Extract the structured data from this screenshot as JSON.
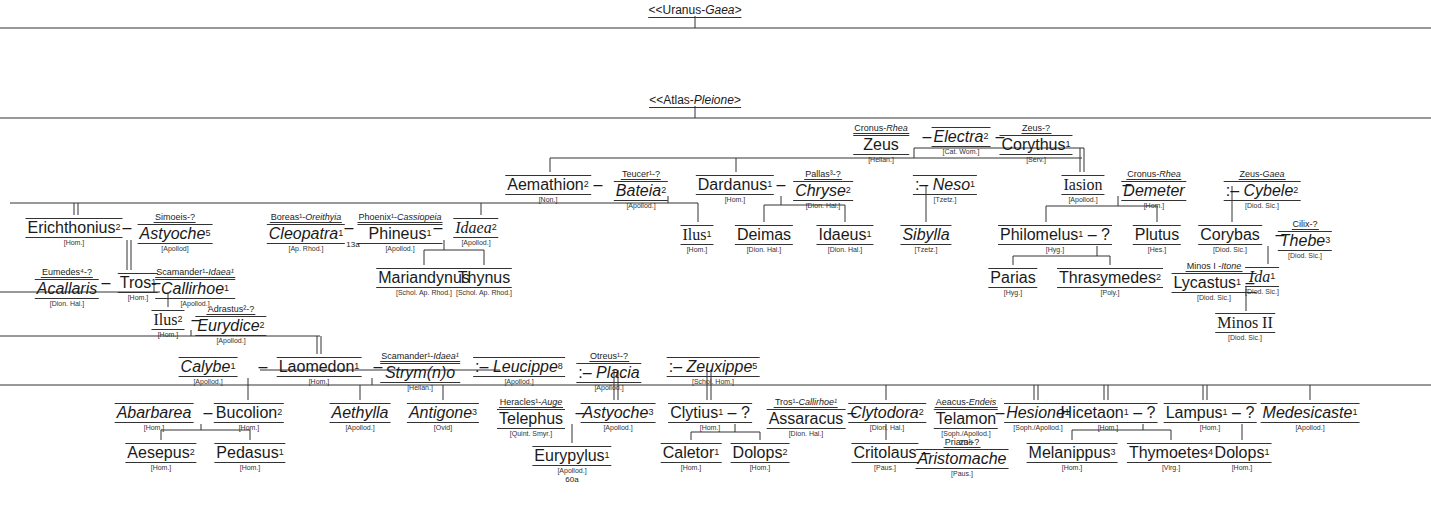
{
  "roots": [
    {
      "id": "uranus",
      "text": "<<Uranus-",
      "fem": "Gaea>",
      "x": 695,
      "y": 4
    },
    {
      "id": "atlas",
      "text": "<<Atlas-",
      "fem": "Pleione>",
      "x": 695,
      "y": 94
    }
  ],
  "nodes": [
    {
      "id": "zeus",
      "name": "Zeus",
      "sup": "",
      "fem": false,
      "src": "[Hellan.]",
      "parents_m": "Cronus-",
      "parents_f": "Rhea",
      "x": 881,
      "y": 117
    },
    {
      "id": "electra",
      "name": "Electra",
      "sup": "2",
      "fem": true,
      "src": "[Cat. Wom.]",
      "parents_m": "",
      "parents_f": "",
      "x": 961,
      "y": 127
    },
    {
      "id": "corythus",
      "name": "Corythus",
      "sup": "1",
      "fem": false,
      "src": "[Serv.]",
      "parents_m": "Zeus-?",
      "parents_f": "",
      "x": 1036,
      "y": 117
    },
    {
      "id": "aemathion",
      "name": "Aemathion",
      "sup": "2",
      "fem": false,
      "src": "[Non.]",
      "parents_m": "",
      "parents_f": "",
      "x": 548,
      "y": 175
    },
    {
      "id": "bateia",
      "name": "Bateia",
      "sup": "2",
      "fem": true,
      "src": "[Apollod.]",
      "parents_m": "Teucer¹-?",
      "parents_f": "",
      "x": 641,
      "y": 163
    },
    {
      "id": "dardanus",
      "name": "Dardanus",
      "sup": "1",
      "fem": false,
      "src": "[Hom.]",
      "parents_m": "",
      "parents_f": "",
      "x": 735,
      "y": 175
    },
    {
      "id": "chryse",
      "name": "Chryse",
      "sup": "2",
      "fem": true,
      "src": "[Dion. Hal.]",
      "parents_m": "Pallas³-?",
      "parents_f": "",
      "x": 823,
      "y": 163
    },
    {
      "id": "neso",
      "name": "Neso",
      "sup": "1",
      "fem": true,
      "prefix": ":–",
      "src": "[Tzetz.]",
      "parents_m": "",
      "parents_f": "",
      "x": 945,
      "y": 175
    },
    {
      "id": "iasion",
      "name": "Iasion",
      "sup": "",
      "fem": false,
      "serif": true,
      "src": "[Apollod.]",
      "parents_m": "",
      "parents_f": "",
      "x": 1083,
      "y": 175
    },
    {
      "id": "demeter",
      "name": "Demeter",
      "sup": "",
      "fem": true,
      "src": "[Hom.]",
      "parents_m": "Cronus-",
      "parents_f": "Rhea",
      "x": 1154,
      "y": 163
    },
    {
      "id": "cybele",
      "name": "Cybele",
      "sup": "2",
      "fem": true,
      "prefix": ":–",
      "src": "[Diod. Sic.]",
      "parents_m": "Zeus-",
      "parents_f": "Gaea",
      "x": 1262,
      "y": 163
    },
    {
      "id": "erichthonius",
      "name": "Erichthonius",
      "sup": "2",
      "fem": false,
      "src": "[Hom.]",
      "parents_m": "",
      "parents_f": "",
      "x": 74,
      "y": 218
    },
    {
      "id": "astyoche5",
      "name": "Astyoche",
      "sup": "5",
      "fem": true,
      "src": "[Apollod]",
      "parents_m": "Simoeis-?",
      "parents_f": "",
      "x": 175,
      "y": 206
    },
    {
      "id": "cleopatra",
      "name": "Cleopatra",
      "sup": "1",
      "fem": true,
      "src": "[Ap. Rhod.]",
      "parents_m": "Boreas¹-",
      "parents_f": "Oreithyia",
      "x": 306,
      "y": 206
    },
    {
      "id": "phineus",
      "name": "Phineus",
      "sup": "1",
      "fem": false,
      "src": "[Apollod.]",
      "parents_m": "Phoenix¹-",
      "parents_f": "Cassiopeia",
      "x": 400,
      "y": 206
    },
    {
      "id": "idaea2",
      "name": "Idaea",
      "sup": "2",
      "fem": true,
      "serif": true,
      "src": "[Apollod.]",
      "parents_m": "",
      "parents_f": "",
      "x": 476,
      "y": 218
    },
    {
      "id": "ilus1",
      "name": "Ilus",
      "sup": "1",
      "fem": false,
      "serif": true,
      "src": "[Hom.]",
      "parents_m": "",
      "parents_f": "",
      "x": 697,
      "y": 225
    },
    {
      "id": "deimas",
      "name": "Deimas",
      "sup": "",
      "fem": false,
      "src": "[Dion. Hal.]",
      "parents_m": "",
      "parents_f": "",
      "x": 764,
      "y": 225
    },
    {
      "id": "idaeus",
      "name": "Idaeus",
      "sup": "1",
      "fem": false,
      "src": "[Dion. Hal.]",
      "parents_m": "",
      "parents_f": "",
      "x": 845,
      "y": 225
    },
    {
      "id": "sibylla",
      "name": "Sibylla",
      "sup": "",
      "fem": true,
      "src": "[Tzetz.]",
      "parents_m": "",
      "parents_f": "",
      "x": 926,
      "y": 225
    },
    {
      "id": "philomelus",
      "name": "Philomelus",
      "sup": "1",
      "fem": false,
      "suffix": "– ?",
      "src": "[Hyg.]",
      "parents_m": "",
      "parents_f": "",
      "x": 1055,
      "y": 225
    },
    {
      "id": "plutus",
      "name": "Plutus",
      "sup": "",
      "fem": false,
      "src": "[Hes.]",
      "parents_m": "",
      "parents_f": "",
      "x": 1157,
      "y": 225
    },
    {
      "id": "corybas",
      "name": "Corybas",
      "sup": "",
      "fem": false,
      "src": "[Diod. Sic.]",
      "parents_m": "",
      "parents_f": "",
      "x": 1230,
      "y": 225
    },
    {
      "id": "thebe",
      "name": "Thebe",
      "sup": "3",
      "fem": true,
      "src": "[Diod. Sic.]",
      "parents_m": "Cilix-?",
      "parents_f": "",
      "x": 1305,
      "y": 213
    },
    {
      "id": "acallaris",
      "name": "Acallaris",
      "sup": "",
      "fem": true,
      "src": "[Dion. Hal.]",
      "parents_m": "Eumedes⁴-?",
      "parents_f": "",
      "x": 67,
      "y": 261
    },
    {
      "id": "tros",
      "name": "Tros",
      "sup": "1",
      "fem": false,
      "src": "[Hom.]",
      "parents_m": "",
      "parents_f": "",
      "x": 138,
      "y": 273
    },
    {
      "id": "callirhoe",
      "name": "Callirhoe",
      "sup": "1",
      "fem": true,
      "src": "[Apollod.]",
      "parents_m": "Scamander¹-",
      "parents_f": "Idaea¹",
      "x": 195,
      "y": 261
    },
    {
      "id": "mariandynus",
      "name": "Mariandynus",
      "sup": "",
      "fem": false,
      "src": "[Schol. Ap. Rhod.]",
      "parents_m": "",
      "parents_f": "",
      "x": 424,
      "y": 268
    },
    {
      "id": "thynus",
      "name": "Thynus",
      "sup": "",
      "fem": false,
      "src": "[Schol. Ap. Rhod.]",
      "parents_m": "",
      "parents_f": "",
      "x": 484,
      "y": 268
    },
    {
      "id": "parias",
      "name": "Parias",
      "sup": "",
      "fem": false,
      "src": "[Hyg.]",
      "parents_m": "",
      "parents_f": "",
      "x": 1013,
      "y": 268
    },
    {
      "id": "thrasymedes",
      "name": "Thrasymedes",
      "sup": "2",
      "fem": false,
      "src": "[Poly.]",
      "parents_m": "",
      "parents_f": "",
      "x": 1110,
      "y": 268
    },
    {
      "id": "lycastus",
      "name": "Lycastus",
      "sup": "1",
      "fem": false,
      "suffix": "–",
      "src": "[Diod. Sic.]",
      "parents_m": "Minos I -",
      "parents_f": "Itone",
      "x": 1214,
      "y": 255
    },
    {
      "id": "ida",
      "name": "Ida",
      "sup": "1",
      "fem": true,
      "serif": true,
      "src": "[Diod. Sic.]",
      "parents_m": "",
      "parents_f": "",
      "x": 1262,
      "y": 267
    },
    {
      "id": "minos2",
      "name": "Minos II",
      "sup": "",
      "fem": false,
      "serif": true,
      "src": "[Diod. Sic.]",
      "parents_m": "",
      "parents_f": "",
      "x": 1245,
      "y": 313
    },
    {
      "id": "ilus2",
      "name": "Ilus",
      "sup": "2",
      "fem": false,
      "serif": true,
      "src": "[Hom.]",
      "parents_m": "",
      "parents_f": "",
      "x": 168,
      "y": 310
    },
    {
      "id": "eurydice",
      "name": "Eurydice",
      "sup": "2",
      "fem": true,
      "src": "[Apollod.]",
      "parents_m": "Adrastus²-?",
      "parents_f": "",
      "x": 231,
      "y": 298
    },
    {
      "id": "calybe",
      "name": "Calybe",
      "sup": "1",
      "fem": true,
      "src": "[Apollod.]",
      "parents_m": "",
      "parents_f": "",
      "x": 208,
      "y": 357
    },
    {
      "id": "laomedon",
      "name": "Laomedon",
      "sup": "1",
      "fem": false,
      "src": "[Hom.]",
      "parents_m": "",
      "parents_f": "",
      "x": 319,
      "y": 357
    },
    {
      "id": "strymo",
      "name": "Strym(n)o",
      "sup": "",
      "fem": true,
      "src": "[Hellan.]",
      "parents_m": "Scamander¹-",
      "parents_f": "Idaea¹",
      "x": 420,
      "y": 345
    },
    {
      "id": "leucippe",
      "name": "Leucippe",
      "sup": "8",
      "fem": true,
      "prefix": ":–",
      "src": "[Apollod.]",
      "parents_m": "",
      "parents_f": "",
      "x": 519,
      "y": 357
    },
    {
      "id": "placia",
      "name": "Placia",
      "sup": "",
      "fem": true,
      "prefix": ":–",
      "src": "[Apollod.]",
      "parents_m": "Otreus¹-?",
      "parents_f": "",
      "x": 609,
      "y": 345
    },
    {
      "id": "zeuxippe",
      "name": "Zeuxippe",
      "sup": "5",
      "fem": true,
      "prefix": ":–",
      "src": "[Schol. Hom.]",
      "parents_m": "",
      "parents_f": "",
      "x": 713,
      "y": 357
    },
    {
      "id": "abarbarea",
      "name": "Abarbarea",
      "sup": "",
      "fem": true,
      "src": "[Hom.]",
      "parents_m": "",
      "parents_f": "",
      "x": 154,
      "y": 403
    },
    {
      "id": "bucolion",
      "name": "Bucolion",
      "sup": "2",
      "fem": false,
      "src": "[Hom.]",
      "parents_m": "",
      "parents_f": "",
      "x": 249,
      "y": 403
    },
    {
      "id": "aethylla",
      "name": "Aethylla",
      "sup": "",
      "fem": true,
      "src": "[Apollod.]",
      "parents_m": "",
      "parents_f": "",
      "x": 360,
      "y": 403
    },
    {
      "id": "antigone",
      "name": "Antigone",
      "sup": "3",
      "fem": true,
      "src": "[Ovid]",
      "parents_m": "",
      "parents_f": "",
      "x": 443,
      "y": 403
    },
    {
      "id": "telephus",
      "name": "Telephus",
      "sup": "",
      "fem": false,
      "src": "[Quint. Smyr.]",
      "parents_m": "Heracles¹-",
      "parents_f": "Auge",
      "x": 531,
      "y": 391
    },
    {
      "id": "astyoche3",
      "name": "Astyoche",
      "sup": "3",
      "fem": true,
      "src": "[Apollod.]",
      "parents_m": "",
      "parents_f": "",
      "x": 618,
      "y": 403
    },
    {
      "id": "clytius",
      "name": "Clytius",
      "sup": "1",
      "fem": false,
      "suffix": "– ?",
      "src": "[Hom.]",
      "parents_m": "",
      "parents_f": "",
      "x": 710,
      "y": 403
    },
    {
      "id": "assaracus",
      "name": "Assaracus",
      "sup": "",
      "fem": false,
      "src": "[Dion. Hal.]",
      "parents_m": "Tros¹-",
      "parents_f": "Callirhoe¹",
      "x": 806,
      "y": 391
    },
    {
      "id": "clytodora",
      "name": "Clytodora",
      "sup": "2",
      "fem": true,
      "src": "[Dion. Hal.]",
      "parents_m": "",
      "parents_f": "",
      "x": 887,
      "y": 403
    },
    {
      "id": "telamon",
      "name": "Telamon",
      "sup": "",
      "fem": false,
      "src": "[Soph./Apollod.]",
      "ref": "23d",
      "parents_m": "Aeacus-",
      "parents_f": "Endeis",
      "x": 966,
      "y": 391
    },
    {
      "id": "hesione",
      "name": "Hesione",
      "sup": "1",
      "fem": true,
      "src": "[Soph./Apollod.]",
      "parents_m": "",
      "parents_f": "",
      "x": 1038,
      "y": 403
    },
    {
      "id": "hicetaon",
      "name": "Hicetaon",
      "sup": "1",
      "fem": false,
      "suffix": "– ?",
      "src": "[Hom.]",
      "parents_m": "",
      "parents_f": "",
      "x": 1108,
      "y": 403
    },
    {
      "id": "lampus",
      "name": "Lampus",
      "sup": "1",
      "fem": false,
      "suffix": "– ?",
      "src": "[Hom.]",
      "parents_m": "",
      "parents_f": "",
      "x": 1210,
      "y": 403
    },
    {
      "id": "medesicaste",
      "name": "Medesicaste",
      "sup": "1",
      "fem": true,
      "src": "[Apollod.]",
      "parents_m": "",
      "parents_f": "",
      "x": 1310,
      "y": 403
    },
    {
      "id": "aesepus",
      "name": "Aesepus",
      "sup": "2",
      "fem": false,
      "src": "[Hom.]",
      "parents_m": "",
      "parents_f": "",
      "x": 161,
      "y": 443
    },
    {
      "id": "pedasus",
      "name": "Pedasus",
      "sup": "1",
      "fem": false,
      "src": "[Hom.]",
      "parents_m": "",
      "parents_f": "",
      "x": 250,
      "y": 443
    },
    {
      "id": "eurypylus",
      "name": "Eurypylus",
      "sup": "1",
      "fem": false,
      "src": "[Apollod.]",
      "ref": "60a",
      "parents_m": "",
      "parents_f": "",
      "x": 572,
      "y": 446
    },
    {
      "id": "caletor",
      "name": "Caletor",
      "sup": "1",
      "fem": false,
      "src": "[Hom.]",
      "parents_m": "",
      "parents_f": "",
      "x": 691,
      "y": 443
    },
    {
      "id": "dolops2",
      "name": "Dolops",
      "sup": "2",
      "fem": false,
      "src": "[Hom.]",
      "parents_m": "",
      "parents_f": "",
      "x": 760,
      "y": 443
    },
    {
      "id": "critolaus",
      "name": "Critolaus",
      "sup": "",
      "fem": false,
      "src": "[Paus.]",
      "parents_m": "",
      "parents_f": "",
      "x": 885,
      "y": 443
    },
    {
      "id": "aristomache",
      "name": "Aristomache",
      "sup": "",
      "fem": true,
      "src": "[Paus.]",
      "parents_m": "Priam¹-?",
      "parents_f": "",
      "x": 962,
      "y": 431
    },
    {
      "id": "melanippus",
      "name": "Melanippus",
      "sup": "3",
      "fem": false,
      "src": "[Hom.]",
      "parents_m": "",
      "parents_f": "",
      "x": 1072,
      "y": 443
    },
    {
      "id": "thymoetes",
      "name": "Thymoetes",
      "sup": "4",
      "fem": false,
      "src": "[Virg.]",
      "parents_m": "",
      "parents_f": "",
      "x": 1171,
      "y": 443
    },
    {
      "id": "dolops1",
      "name": "Dolops",
      "sup": "1",
      "fem": false,
      "src": "[Hom.]",
      "parents_m": "",
      "parents_f": "",
      "x": 1242,
      "y": 443
    }
  ],
  "refs": {
    "cleopatra_ref": "13a"
  },
  "dashes": [
    {
      "x": 927,
      "y": 127
    },
    {
      "x": 1000,
      "y": 127
    },
    {
      "x": 598,
      "y": 175
    },
    {
      "x": 781,
      "y": 175
    },
    {
      "x": 127,
      "y": 218
    },
    {
      "x": 349,
      "y": 218
    },
    {
      "x": 438,
      "y": 218
    },
    {
      "x": 1127,
      "y": 175
    },
    {
      "x": 1280,
      "y": 225
    },
    {
      "x": 106,
      "y": 273
    },
    {
      "x": 156,
      "y": 273
    },
    {
      "x": 196,
      "y": 310
    },
    {
      "x": 263,
      "y": 357
    },
    {
      "x": 378,
      "y": 357
    },
    {
      "x": 208,
      "y": 403
    },
    {
      "x": 580,
      "y": 403
    },
    {
      "x": 852,
      "y": 403
    },
    {
      "x": 1000,
      "y": 403
    },
    {
      "x": 926,
      "y": 443
    }
  ]
}
